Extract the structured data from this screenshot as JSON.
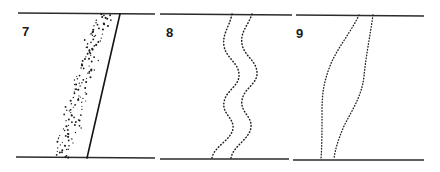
{
  "figure": {
    "background_color": "#ffffff",
    "ink_color": "#1e1e1e",
    "width": 440,
    "height": 172,
    "rules": {
      "top_y": 14,
      "bottom_y": 158,
      "stroke_color": "#2b2b2b",
      "segments": [
        {
          "name": "rule-top-panel-7",
          "x1": 18,
          "x2": 155,
          "y": 13
        },
        {
          "name": "rule-top-panel-8",
          "x1": 160,
          "x2": 292,
          "y": 14
        },
        {
          "name": "rule-top-panel-9",
          "x1": 296,
          "x2": 424,
          "y": 15
        },
        {
          "name": "rule-bottom-panel-7",
          "x1": 16,
          "x2": 155,
          "y": 157
        },
        {
          "name": "rule-bottom-panel-8",
          "x1": 160,
          "x2": 289,
          "y": 159
        },
        {
          "name": "rule-bottom-panel-9",
          "x1": 293,
          "x2": 424,
          "y": 160
        }
      ]
    },
    "panels": [
      {
        "id": "panel-7",
        "number": "7",
        "number_x": 22,
        "number_y": 36,
        "description": "Dense scattered dotted band slanting left-down beside a straight solid line",
        "traces": [
          {
            "name": "noisy-dotted-band",
            "style": "scatter-dotted",
            "top_x": 103,
            "bottom_x": 62,
            "spread": 9,
            "points": 150
          },
          {
            "name": "solid-straight-line",
            "style": "solid",
            "top_x": 120,
            "bottom_x": 87,
            "path": "M 120 14 L 87 158"
          }
        ]
      },
      {
        "id": "panel-8",
        "number": "8",
        "number_x": 166,
        "number_y": 37,
        "description": "Two strongly wavy dotted traces running top to bottom",
        "traces": [
          {
            "name": "wavy-dotted-left",
            "style": "dotted",
            "top_x": 232,
            "bottom_x": 212,
            "path": "M 232 14 C 229 28 222 34 224 46 C 226 58 238 62 239 74 C 240 86 226 90 224 102 C 222 114 234 118 233 128 C 232 140 214 146 212 158"
          },
          {
            "name": "wavy-dotted-right",
            "style": "dotted",
            "top_x": 252,
            "bottom_x": 231,
            "path": "M 252 14 C 248 26 240 32 242 44 C 244 56 256 60 257 72 C 258 84 244 88 242 100 C 240 112 252 116 251 127 C 250 139 233 146 231 158"
          }
        ]
      },
      {
        "id": "panel-9",
        "number": "9",
        "number_x": 296,
        "number_y": 38,
        "description": "Two gently sinuous dotted traces, nearly parallel, bowing left",
        "traces": [
          {
            "name": "sinuous-dotted-left",
            "style": "dotted",
            "top_x": 359,
            "bottom_x": 321,
            "path": "M 359 15 C 350 34 337 48 330 66 C 323 84 322 96 322 112 C 322 130 322 146 321 159"
          },
          {
            "name": "sinuous-dotted-right",
            "style": "dotted",
            "top_x": 373,
            "bottom_x": 334,
            "path": "M 373 15 C 370 36 366 56 364 76 C 362 96 352 110 344 126 C 338 140 335 150 334 159"
          }
        ]
      }
    ]
  }
}
